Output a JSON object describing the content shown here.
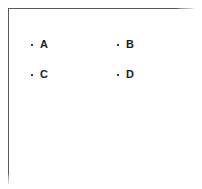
{
  "document": {
    "title": "Bulleted List",
    "background_color": "#ffffff",
    "frame": {
      "border_color": "#5a5a5a",
      "top_rule_visible": true,
      "left_rule_visible": true,
      "right_rule_visible": false,
      "bottom_rule_visible": false
    }
  },
  "list": {
    "bullet_glyph": "·",
    "bullet_color": "#3b3b3b",
    "text_color": "#1d1d1d",
    "columns": 2,
    "items": [
      {
        "bullet": "·",
        "label": "A"
      },
      {
        "bullet": "·",
        "label": "B"
      },
      {
        "bullet": "·",
        "label": "C"
      },
      {
        "bullet": "·",
        "label": "D"
      }
    ]
  }
}
